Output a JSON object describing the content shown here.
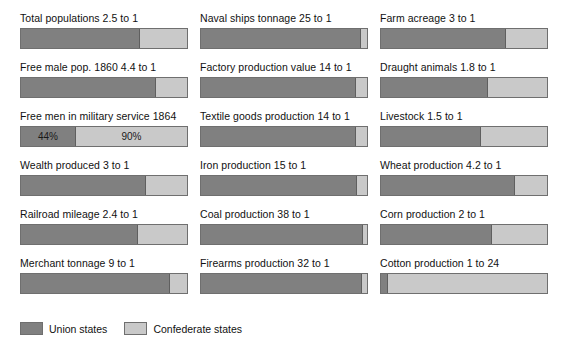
{
  "legend": {
    "union": {
      "label": "Union states",
      "color": "#808080",
      "icon": "square-swatch-icon"
    },
    "confederate": {
      "label": "Confederate states",
      "color": "#c9c9c9",
      "icon": "square-swatch-icon"
    }
  },
  "chart_data": {
    "type": "bar",
    "title": "",
    "subtitle": "",
    "xlabel": "",
    "ylabel": "",
    "grid": false,
    "legend_position": "bottom-left",
    "orientation": "horizontal-stacked-100pct",
    "series": [
      {
        "name": "Union states",
        "color": "#808080"
      },
      {
        "name": "Confederate states",
        "color": "#c9c9c9"
      }
    ],
    "categories": [
      "Total populations",
      "Free male pop. 1860",
      "Free men in military service 1864",
      "Wealth produced",
      "Railroad mileage",
      "Merchant tonnage",
      "Naval ships tonnage",
      "Factory production value",
      "Textile goods production",
      "Iron production",
      "Coal production",
      "Firearms production",
      "Farm acreage",
      "Draught animals",
      "Livestock",
      "Wheat production",
      "Corn production",
      "Cotton production"
    ],
    "items": [
      {
        "label": "Total populations 2.5 to 1",
        "category": "Total populations",
        "ratio_text": "2.5 to 1",
        "union_share_pct": 71.4,
        "confederate_share_pct": 28.6,
        "union_value_label": "",
        "confederate_value_label": ""
      },
      {
        "label": "Free male pop. 1860 4.4 to 1",
        "category": "Free male pop. 1860",
        "ratio_text": "4.4 to 1",
        "union_share_pct": 81.5,
        "confederate_share_pct": 18.5,
        "union_value_label": "",
        "confederate_value_label": ""
      },
      {
        "label": "Free men in military service 1864",
        "category": "Free men in military service 1864",
        "ratio_text": "",
        "union_share_pct": 33.0,
        "confederate_share_pct": 67.0,
        "union_value_label": "44%",
        "confederate_value_label": "90%"
      },
      {
        "label": "Wealth produced 3 to 1",
        "category": "Wealth produced",
        "ratio_text": "3 to 1",
        "union_share_pct": 75.0,
        "confederate_share_pct": 25.0,
        "union_value_label": "",
        "confederate_value_label": ""
      },
      {
        "label": "Railroad mileage 2.4 to 1",
        "category": "Railroad mileage",
        "ratio_text": "2.4 to 1",
        "union_share_pct": 70.6,
        "confederate_share_pct": 29.4,
        "union_value_label": "",
        "confederate_value_label": ""
      },
      {
        "label": "Merchant tonnage 9 to 1",
        "category": "Merchant tonnage",
        "ratio_text": "9 to 1",
        "union_share_pct": 90.0,
        "confederate_share_pct": 10.0,
        "union_value_label": "",
        "confederate_value_label": ""
      },
      {
        "label": "Naval ships tonnage 25 to 1",
        "category": "Naval ships tonnage",
        "ratio_text": "25 to 1",
        "union_share_pct": 96.2,
        "confederate_share_pct": 3.8,
        "union_value_label": "",
        "confederate_value_label": ""
      },
      {
        "label": "Factory production value 14 to 1",
        "category": "Factory production value",
        "ratio_text": "14 to 1",
        "union_share_pct": 93.3,
        "confederate_share_pct": 6.7,
        "union_value_label": "",
        "confederate_value_label": ""
      },
      {
        "label": "Textile goods production 14 to 1",
        "category": "Textile goods production",
        "ratio_text": "14 to 1",
        "union_share_pct": 93.3,
        "confederate_share_pct": 6.7,
        "union_value_label": "",
        "confederate_value_label": ""
      },
      {
        "label": "Iron production 15 to 1",
        "category": "Iron production",
        "ratio_text": "15 to 1",
        "union_share_pct": 93.8,
        "confederate_share_pct": 6.2,
        "union_value_label": "",
        "confederate_value_label": ""
      },
      {
        "label": "Coal production 38 to 1",
        "category": "Coal production",
        "ratio_text": "38 to 1",
        "union_share_pct": 97.4,
        "confederate_share_pct": 2.6,
        "union_value_label": "",
        "confederate_value_label": ""
      },
      {
        "label": "Firearms production 32 to 1",
        "category": "Firearms production",
        "ratio_text": "32 to 1",
        "union_share_pct": 97.0,
        "confederate_share_pct": 3.0,
        "union_value_label": "",
        "confederate_value_label": ""
      },
      {
        "label": "Farm acreage 3 to 1",
        "category": "Farm acreage",
        "ratio_text": "3 to 1",
        "union_share_pct": 75.0,
        "confederate_share_pct": 25.0,
        "union_value_label": "",
        "confederate_value_label": ""
      },
      {
        "label": "Draught animals 1.8 to 1",
        "category": "Draught animals",
        "ratio_text": "1.8 to 1",
        "union_share_pct": 64.3,
        "confederate_share_pct": 35.7,
        "union_value_label": "",
        "confederate_value_label": ""
      },
      {
        "label": "Livestock 1.5 to 1",
        "category": "Livestock",
        "ratio_text": "1.5 to 1",
        "union_share_pct": 60.0,
        "confederate_share_pct": 40.0,
        "union_value_label": "",
        "confederate_value_label": ""
      },
      {
        "label": "Wheat production 4.2 to 1",
        "category": "Wheat production",
        "ratio_text": "4.2 to 1",
        "union_share_pct": 80.8,
        "confederate_share_pct": 19.2,
        "union_value_label": "",
        "confederate_value_label": ""
      },
      {
        "label": "Corn production 2 to 1",
        "category": "Corn production",
        "ratio_text": "2 to 1",
        "union_share_pct": 66.7,
        "confederate_share_pct": 33.3,
        "union_value_label": "",
        "confederate_value_label": ""
      },
      {
        "label": "Cotton production 1 to 24",
        "category": "Cotton production",
        "ratio_text": "1 to 24",
        "union_share_pct": 4.0,
        "confederate_share_pct": 96.0,
        "union_value_label": "",
        "confederate_value_label": ""
      }
    ]
  }
}
